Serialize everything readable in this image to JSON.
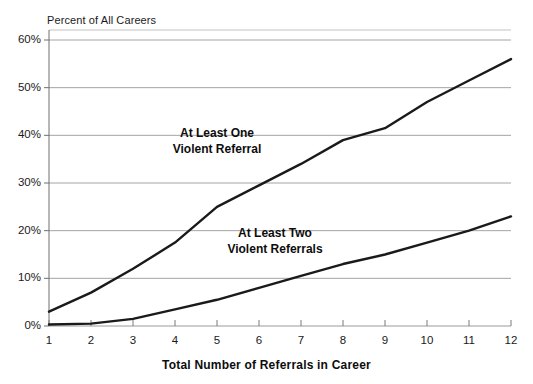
{
  "chart_data": {
    "type": "line",
    "title": "",
    "xlabel": "Total Number of Referrals in Career",
    "ylabel": "Percent of All Careers",
    "x": [
      1,
      2,
      3,
      4,
      5,
      6,
      7,
      8,
      9,
      10,
      11,
      12
    ],
    "xtick_labels": [
      "1",
      "2",
      "3",
      "4",
      "5",
      "6",
      "7",
      "8",
      "9",
      "10",
      "11",
      "12"
    ],
    "ytick_labels": [
      "0%",
      "10%",
      "20%",
      "30%",
      "40%",
      "50%",
      "60%"
    ],
    "ytick_values": [
      0,
      10,
      20,
      30,
      40,
      50,
      60
    ],
    "xlim": [
      1,
      12
    ],
    "ylim": [
      0,
      60
    ],
    "grid": "horizontal",
    "legend_position": "inline-annotation",
    "series": [
      {
        "name": "At Least One Violent Referral",
        "label_line_1": "At Least One",
        "label_line_2": "Violent Referral",
        "color": "#1a1a1a",
        "values": [
          3,
          7,
          12,
          17.5,
          25,
          29.5,
          34,
          39,
          41.5,
          47,
          51.5,
          56
        ]
      },
      {
        "name": "At Least Two Violent Referrals",
        "label_line_1": "At Least Two",
        "label_line_2": "Violent Referrals",
        "color": "#1a1a1a",
        "values": [
          0.3,
          0.5,
          1.5,
          3.5,
          5.5,
          8,
          10.5,
          13,
          15,
          17.5,
          20,
          23
        ]
      }
    ]
  },
  "axes": {
    "y_title": "Percent of All Careers",
    "x_title": "Total Number of Referrals in Career"
  }
}
